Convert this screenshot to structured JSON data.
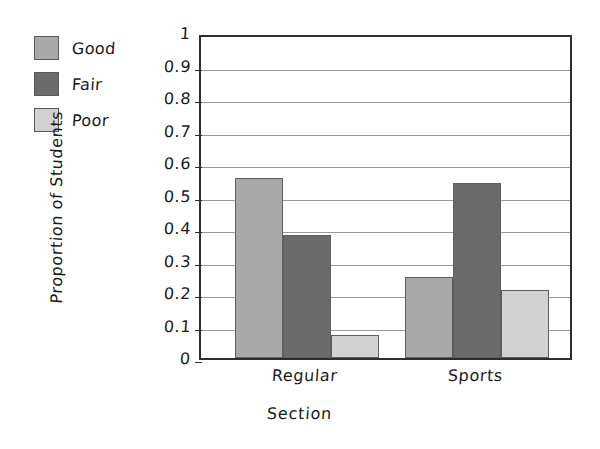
{
  "chart_data": {
    "type": "bar",
    "title": "",
    "xlabel": "Section",
    "ylabel": "Proportion of Students",
    "categories": [
      "Regular",
      "Sports"
    ],
    "series": [
      {
        "name": "Good",
        "color": "#a9a9a9",
        "values": [
          0.555,
          0.248
        ]
      },
      {
        "name": "Fair",
        "color": "#6b6b6b",
        "values": [
          0.377,
          0.537
        ]
      },
      {
        "name": "Poor",
        "color": "#d2d2d2",
        "values": [
          0.071,
          0.209
        ]
      }
    ],
    "ylim": [
      0,
      1
    ],
    "ytick_labels": [
      "1",
      "0.9",
      "0.8",
      "0.7",
      "0.6",
      "0.5",
      "0.4",
      "0.3",
      "0.2",
      "0.1",
      "0"
    ],
    "ytick_values": [
      1,
      0.9,
      0.8,
      0.7,
      0.6,
      0.5,
      0.4,
      0.3,
      0.2,
      0.1,
      0
    ],
    "grid": true,
    "legend_position": "top-left",
    "legend": [
      "Good",
      "Fair",
      "Poor"
    ]
  },
  "legend": {
    "items": [
      {
        "label": "Good",
        "color": "#a9a9a9"
      },
      {
        "label": "Fair",
        "color": "#6b6b6b"
      },
      {
        "label": "Poor",
        "color": "#d2d2d2"
      }
    ]
  },
  "axes": {
    "y_title": "Proportion of Students",
    "x_title": "Section"
  }
}
